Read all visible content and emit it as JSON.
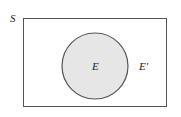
{
  "diagram": {
    "type": "venn",
    "sample_space_label": "S",
    "event_label": "E",
    "complement_label": "E′",
    "colors": {
      "event_fill": "#e6e6e6",
      "stroke": "#555555",
      "background": "#ffffff"
    }
  }
}
